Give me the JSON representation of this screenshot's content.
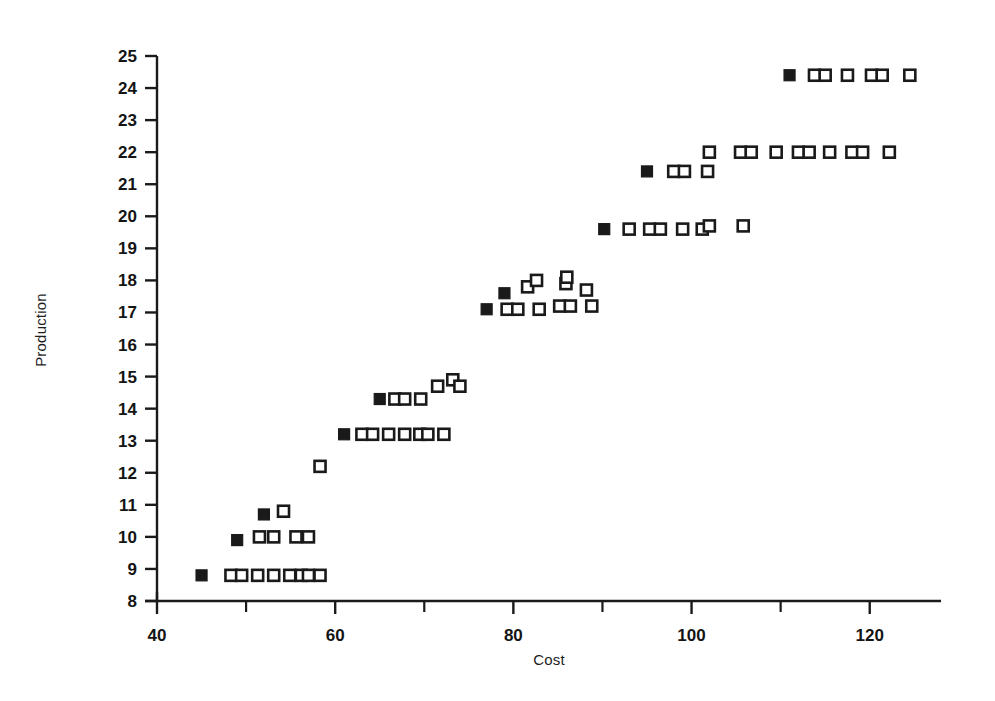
{
  "chart_data": {
    "type": "scatter",
    "title": "",
    "xlabel": "Cost",
    "ylabel": "Production",
    "xlim": [
      40,
      128
    ],
    "ylim": [
      8,
      25
    ],
    "grid": false,
    "legend": "none",
    "x_major_ticks": [
      40,
      60,
      80,
      100,
      120
    ],
    "x_minor_ticks": [
      50,
      70,
      90,
      110
    ],
    "x_ticklabels": [
      "40",
      "60",
      "80",
      "100",
      "120"
    ],
    "y_ticks": [
      8,
      9,
      10,
      11,
      12,
      13,
      14,
      15,
      16,
      17,
      18,
      19,
      20,
      21,
      22,
      23,
      24,
      25
    ],
    "y_ticklabels": [
      "8",
      "9",
      "10",
      "11",
      "12",
      "13",
      "14",
      "15",
      "16",
      "17",
      "18",
      "19",
      "20",
      "21",
      "22",
      "23",
      "24",
      "25"
    ],
    "marker_size_px": 11,
    "series": [
      {
        "name": "filled",
        "marker": "filled-square",
        "color": "#1a1a1a",
        "points": [
          [
            45.0,
            8.8
          ],
          [
            49.0,
            9.9
          ],
          [
            52.0,
            10.7
          ],
          [
            61.0,
            13.2
          ],
          [
            65.0,
            14.3
          ],
          [
            77.0,
            17.1
          ],
          [
            79.0,
            17.6
          ],
          [
            90.2,
            19.6
          ],
          [
            95.0,
            21.4
          ],
          [
            111.0,
            24.4
          ]
        ]
      },
      {
        "name": "hollow",
        "marker": "open-square",
        "color": "#1a1a1a",
        "points": [
          [
            48.3,
            8.8
          ],
          [
            49.5,
            8.8
          ],
          [
            51.3,
            8.8
          ],
          [
            53.1,
            8.8
          ],
          [
            54.9,
            8.8
          ],
          [
            56.2,
            8.8
          ],
          [
            57.0,
            8.8
          ],
          [
            58.3,
            8.8
          ],
          [
            51.5,
            10.0
          ],
          [
            53.1,
            10.0
          ],
          [
            55.6,
            10.0
          ],
          [
            57.0,
            10.0
          ],
          [
            54.2,
            10.8
          ],
          [
            58.3,
            12.2
          ],
          [
            63.0,
            13.2
          ],
          [
            64.2,
            13.2
          ],
          [
            66.0,
            13.2
          ],
          [
            67.8,
            13.2
          ],
          [
            69.5,
            13.2
          ],
          [
            70.4,
            13.2
          ],
          [
            72.2,
            13.2
          ],
          [
            66.7,
            14.3
          ],
          [
            67.8,
            14.3
          ],
          [
            69.6,
            14.3
          ],
          [
            71.5,
            14.7
          ],
          [
            73.2,
            14.9
          ],
          [
            74.0,
            14.7
          ],
          [
            79.3,
            17.1
          ],
          [
            80.5,
            17.1
          ],
          [
            82.9,
            17.1
          ],
          [
            85.2,
            17.2
          ],
          [
            86.4,
            17.2
          ],
          [
            88.8,
            17.2
          ],
          [
            81.6,
            17.8
          ],
          [
            82.6,
            18.0
          ],
          [
            85.9,
            17.9
          ],
          [
            86.0,
            18.1
          ],
          [
            88.2,
            17.7
          ],
          [
            93.0,
            19.6
          ],
          [
            95.3,
            19.6
          ],
          [
            96.5,
            19.6
          ],
          [
            99.0,
            19.6
          ],
          [
            101.2,
            19.6
          ],
          [
            102.0,
            19.7
          ],
          [
            105.8,
            19.7
          ],
          [
            98.0,
            21.4
          ],
          [
            99.2,
            21.4
          ],
          [
            101.8,
            21.4
          ],
          [
            102.0,
            22.0
          ],
          [
            105.5,
            22.0
          ],
          [
            106.7,
            22.0
          ],
          [
            109.5,
            22.0
          ],
          [
            112.0,
            22.0
          ],
          [
            113.2,
            22.0
          ],
          [
            115.5,
            22.0
          ],
          [
            118.0,
            22.0
          ],
          [
            119.2,
            22.0
          ],
          [
            122.2,
            22.0
          ],
          [
            113.8,
            24.4
          ],
          [
            115.0,
            24.4
          ],
          [
            117.5,
            24.4
          ],
          [
            120.2,
            24.4
          ],
          [
            121.4,
            24.4
          ],
          [
            124.5,
            24.4
          ]
        ]
      }
    ]
  },
  "figure": {
    "xlabel": "Cost",
    "ylabel": "Production"
  }
}
